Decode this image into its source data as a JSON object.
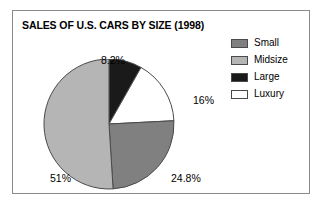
{
  "figure": {
    "title": "SALES OF U.S. CARS BY SIZE (1998)",
    "border_color": "#8a8a8a",
    "background": "#ffffff"
  },
  "legend": {
    "position": "top-right",
    "items": [
      {
        "label": "Small",
        "color": "#808080"
      },
      {
        "label": "Midsize",
        "color": "#b5b5b5"
      },
      {
        "label": "Large",
        "color": "#1a1a1a"
      },
      {
        "label": "Luxury",
        "color": "#ffffff"
      }
    ]
  },
  "labels": {
    "large": "8.2%",
    "luxury": "16%",
    "small": "24.8%",
    "midsize": "51%"
  },
  "chart_data": {
    "type": "pie",
    "title": "SALES OF U.S. CARS BY SIZE (1998)",
    "xlabel": "",
    "ylabel": "",
    "legend_position": "top-right",
    "grid": false,
    "start_angle_deg": 0,
    "direction": "clockwise",
    "categories": [
      "Large",
      "Luxury",
      "Small",
      "Midsize"
    ],
    "values": [
      8.2,
      16,
      24.8,
      51
    ],
    "data_labels": [
      "8.2%",
      "16%",
      "24.8%",
      "51%"
    ],
    "colors": [
      "#1a1a1a",
      "#ffffff",
      "#808080",
      "#b5b5b5"
    ],
    "slices": [
      {
        "name": "Large",
        "value": 8.2,
        "label": "8.2%",
        "color": "#1a1a1a"
      },
      {
        "name": "Luxury",
        "value": 16,
        "label": "16%",
        "color": "#ffffff"
      },
      {
        "name": "Small",
        "value": 24.8,
        "label": "24.8%",
        "color": "#808080"
      },
      {
        "name": "Midsize",
        "value": 51,
        "label": "51%",
        "color": "#b5b5b5"
      }
    ]
  }
}
